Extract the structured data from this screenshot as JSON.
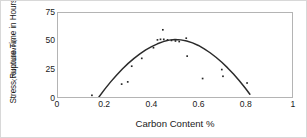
{
  "chart_data": {
    "type": "scatter",
    "title": "",
    "xlabel": "Carbon Content %",
    "ylabel": "Stress Rupture Time in Hours",
    "ylabel_sub": "( 750°C/138MPa)",
    "xlim": [
      0,
      1
    ],
    "ylim": [
      0,
      75
    ],
    "xticks": [
      "0",
      "0.2",
      "0.4",
      "0.6",
      "0.8",
      "1"
    ],
    "xtick_values": [
      0,
      0.2,
      0.4,
      0.6,
      0.8,
      1
    ],
    "yticks": [
      "0",
      "25",
      "50",
      "75"
    ],
    "ytick_values": [
      0,
      25,
      50,
      75
    ],
    "grid": false,
    "legend": "none",
    "marker_color": "#262626",
    "curve_color": "#2b2b2b",
    "frame_color": "#b4b4b4",
    "series": [
      {
        "name": "Measured stress rupture time",
        "type": "scatter",
        "points": [
          {
            "x": 0.145,
            "y": 1.5
          },
          {
            "x": 0.272,
            "y": 11.5
          },
          {
            "x": 0.298,
            "y": 13.5
          },
          {
            "x": 0.315,
            "y": 27.5
          },
          {
            "x": 0.358,
            "y": 34.5
          },
          {
            "x": 0.408,
            "y": 44.0
          },
          {
            "x": 0.425,
            "y": 51.0
          },
          {
            "x": 0.438,
            "y": 51.5
          },
          {
            "x": 0.448,
            "y": 60.0
          },
          {
            "x": 0.452,
            "y": 51.5
          },
          {
            "x": 0.468,
            "y": 51.0
          },
          {
            "x": 0.485,
            "y": 50.5
          },
          {
            "x": 0.502,
            "y": 50.0
          },
          {
            "x": 0.518,
            "y": 49.5
          },
          {
            "x": 0.548,
            "y": 52.5
          },
          {
            "x": 0.552,
            "y": 36.5
          },
          {
            "x": 0.618,
            "y": 16.5
          },
          {
            "x": 0.7,
            "y": 24.5
          },
          {
            "x": 0.705,
            "y": 18.5
          },
          {
            "x": 0.808,
            "y": 12.5
          }
        ]
      },
      {
        "name": "Fitted parabolic trend",
        "type": "line",
        "points": [
          {
            "x": 0.175,
            "y": 0.0
          },
          {
            "x": 0.2,
            "y": 7.0
          },
          {
            "x": 0.225,
            "y": 13.5
          },
          {
            "x": 0.25,
            "y": 19.5
          },
          {
            "x": 0.275,
            "y": 25.0
          },
          {
            "x": 0.3,
            "y": 30.0
          },
          {
            "x": 0.325,
            "y": 34.5
          },
          {
            "x": 0.35,
            "y": 38.5
          },
          {
            "x": 0.375,
            "y": 42.0
          },
          {
            "x": 0.4,
            "y": 45.0
          },
          {
            "x": 0.425,
            "y": 47.5
          },
          {
            "x": 0.45,
            "y": 49.5
          },
          {
            "x": 0.475,
            "y": 50.8
          },
          {
            "x": 0.5,
            "y": 51.3
          },
          {
            "x": 0.525,
            "y": 51.0
          },
          {
            "x": 0.55,
            "y": 50.0
          },
          {
            "x": 0.575,
            "y": 48.3
          },
          {
            "x": 0.6,
            "y": 46.0
          },
          {
            "x": 0.625,
            "y": 43.0
          },
          {
            "x": 0.65,
            "y": 39.5
          },
          {
            "x": 0.675,
            "y": 35.5
          },
          {
            "x": 0.7,
            "y": 31.0
          },
          {
            "x": 0.725,
            "y": 26.0
          },
          {
            "x": 0.75,
            "y": 20.5
          },
          {
            "x": 0.775,
            "y": 14.5
          },
          {
            "x": 0.8,
            "y": 8.0
          },
          {
            "x": 0.82,
            "y": 2.5
          }
        ]
      }
    ]
  }
}
